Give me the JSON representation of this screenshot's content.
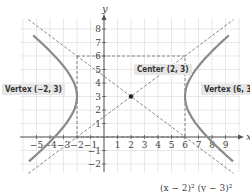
{
  "chart_data": {
    "type": "line",
    "title": "",
    "xlabel": "x",
    "ylabel": "y",
    "xlim": [
      -6,
      10
    ],
    "ylim": [
      -2.5,
      9.5
    ],
    "grid": true,
    "x_ticks": [
      -5,
      -4,
      -3,
      -2,
      -1,
      1,
      2,
      3,
      4,
      5,
      6,
      7,
      8,
      9
    ],
    "y_ticks": [
      -2,
      -1,
      1,
      2,
      3,
      4,
      5,
      6,
      7,
      8
    ],
    "x_tick_labels": [
      "−5",
      "−4",
      "−3",
      "−2",
      "−1",
      "1",
      "2",
      "3",
      "4",
      "5",
      "6",
      "7",
      "8",
      "9"
    ],
    "y_tick_labels": [
      "−2",
      "−1",
      "1",
      "2",
      "3",
      "4",
      "5",
      "6",
      "7",
      "8"
    ],
    "series": [
      {
        "name": "hyperbola",
        "equation": "(x − 2)²/16 − (y − 3)²/9 = 1",
        "style": "solid-gray"
      },
      {
        "name": "asymptote 1",
        "equation": "y − 3 = (3/4)(x − 2)",
        "style": "dashed"
      },
      {
        "name": "asymptote 2",
        "equation": "y − 3 = −(3/4)(x − 2)",
        "style": "dashed"
      },
      {
        "name": "central rectangle",
        "x_range": [
          -2,
          6
        ],
        "y_range": [
          0,
          6
        ],
        "style": "dashed"
      }
    ],
    "points": [
      {
        "label": "Center (2, 3)",
        "x": 2,
        "y": 3
      },
      {
        "label": "Vertex (−2, 3)",
        "x": -2,
        "y": 3
      },
      {
        "label": "Vertex (6, 3)",
        "x": 6,
        "y": 3
      }
    ],
    "annotations": [
      "Center (2, 3)",
      "Vertex (−2, 3)",
      "Vertex (6, 3)"
    ]
  },
  "labels": {
    "center": "Center (2, 3)",
    "vertex_left": "Vertex (−2, 3)",
    "vertex_right": "Vertex (6, 3)",
    "x_axis": "x",
    "y_axis": "y",
    "equation_partial": "(x − 2)²     (y − 3)²"
  }
}
